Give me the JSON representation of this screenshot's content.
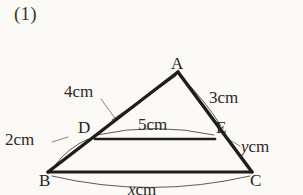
{
  "page": {
    "problem_number": "(1)",
    "background_color": "#fbfaf7",
    "ink_color": "#1f1c1a"
  },
  "figure": {
    "type": "geometry-diagram",
    "shape": "triangle-with-parallel-segment",
    "vertices": [
      {
        "name": "A",
        "label": "A",
        "x": 178,
        "y": 72
      },
      {
        "name": "B",
        "label": "B",
        "x": 48,
        "y": 172
      },
      {
        "name": "C",
        "label": "C",
        "x": 252,
        "y": 172
      },
      {
        "name": "D",
        "label": "D",
        "x": 95,
        "y": 139
      },
      {
        "name": "E",
        "label": "E",
        "x": 215,
        "y": 139
      }
    ],
    "segments": [
      {
        "name": "AB",
        "from": "A",
        "to": "B"
      },
      {
        "name": "AC",
        "from": "A",
        "to": "C"
      },
      {
        "name": "BC",
        "from": "B",
        "to": "C"
      },
      {
        "name": "DE",
        "from": "D",
        "to": "E"
      }
    ],
    "measures": {
      "ad": "4cm",
      "ae": "3cm",
      "de": "5cm",
      "db": "2cm",
      "ec_value": "y",
      "ec_unit": "cm",
      "bc_value": "x",
      "bc_unit": "cm"
    }
  }
}
